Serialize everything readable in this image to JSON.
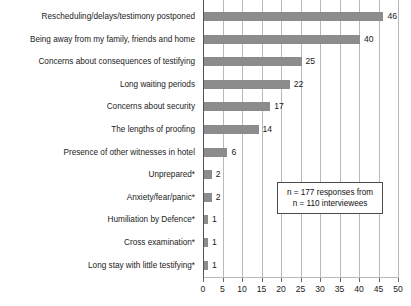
{
  "chart_data": {
    "type": "bar",
    "orientation": "horizontal",
    "title": "",
    "xlabel": "",
    "ylabel": "",
    "xlim": [
      0,
      50
    ],
    "xticks": [
      0,
      5,
      10,
      15,
      20,
      25,
      30,
      35,
      40,
      45,
      50
    ],
    "grid": true,
    "legend": null,
    "categories": [
      "Rescheduling/delays/testimony postponed",
      "Being away from my family, friends and home",
      "Concerns about consequences of testifying",
      "Long waiting periods",
      "Concerns about security",
      "The lengths of proofing",
      "Presence of other witnesses in hotel",
      "Unprepared*",
      "Anxiety/fear/panic*",
      "Humiliation by Defence*",
      "Cross examination*",
      "Long stay with little testifying*"
    ],
    "values": [
      46,
      40,
      25,
      22,
      17,
      14,
      6,
      2,
      2,
      1,
      1,
      1
    ],
    "value_labels": [
      "46",
      "40",
      "25",
      "22",
      "17",
      "14",
      "6",
      "2",
      "2",
      "1",
      "1",
      "1"
    ],
    "bar_color": "#8c8c8c",
    "annotations": [
      {
        "lines": [
          "n = 177 responses from",
          "n = 110 interviewees"
        ],
        "boxed": true
      }
    ]
  },
  "annotation_box": {
    "line1": "n = 177 responses from",
    "line2": "n = 110 interviewees"
  }
}
